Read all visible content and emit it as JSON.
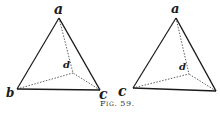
{
  "figure": {
    "caption": "Fig. 59.",
    "left": {
      "labels": {
        "a": "a",
        "b": "b",
        "c": "c",
        "d": "d"
      }
    },
    "right": {
      "labels": {
        "a": "a",
        "c": "c",
        "d": "d"
      }
    }
  }
}
